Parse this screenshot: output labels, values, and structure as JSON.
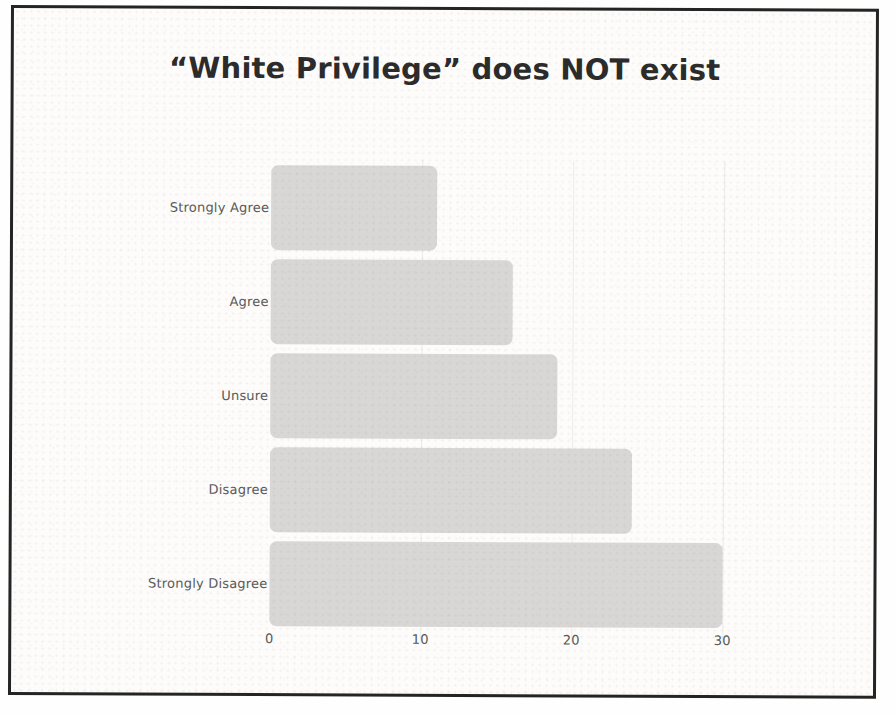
{
  "chart_data": {
    "type": "bar",
    "orientation": "horizontal",
    "title": "“White Privilege” does NOT exist",
    "categories": [
      "Strongly Agree",
      "Agree",
      "Unsure",
      "Disagree",
      "Strongly Disagree"
    ],
    "values": [
      11,
      16,
      19,
      24,
      30
    ],
    "xlabel": "",
    "ylabel": "",
    "xlim": [
      0,
      30
    ],
    "xticks": [
      0,
      10,
      20,
      30
    ],
    "xtick_labels": [
      "0",
      "10",
      "20",
      "30"
    ],
    "grid": "faint vertical gridlines at x ticks",
    "legend": "none",
    "bar_color": "#d8d7d5",
    "paper_background": "#fdfcfa",
    "frame_border_color": "#242424",
    "title_color": "#2b2b2b",
    "label_color": "#595959"
  }
}
